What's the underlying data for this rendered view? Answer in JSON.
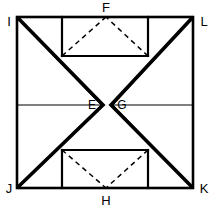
{
  "figure": {
    "background_color": "#ffffff",
    "line_color": "#000000",
    "labels": {
      "top_left": "I",
      "top_center": "F",
      "top_right": "L",
      "mid_left_interior": "E",
      "mid_right_interior": "G",
      "bottom_left": "J",
      "bottom_center": "H",
      "bottom_right": "K"
    },
    "geometry": {
      "square": {
        "left": 17,
        "top": 17,
        "right": 193,
        "bottom": 188
      },
      "midline_y": 105,
      "apex_left_x": 103,
      "apex_right_x": 111,
      "top_rect": {
        "left": 62,
        "right": 148,
        "bottom": 56
      },
      "bottom_rect": {
        "left": 62,
        "right": 148,
        "top": 150
      },
      "top_fold_apex_x": 106,
      "bottom_fold_apex_x": 106
    }
  }
}
